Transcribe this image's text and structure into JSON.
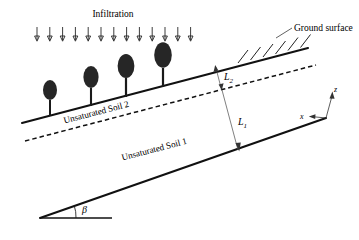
{
  "figure": {
    "background_color": "#ffffff",
    "ink_color": "#111111"
  },
  "labels": {
    "infiltration": "Infiltration",
    "ground_surface": "Ground surface",
    "soil_upper": "Unsaturated Soil 2",
    "soil_lower": "Unsaturated Soil 1",
    "depth_upper": "L",
    "depth_upper_sub": "2",
    "depth_lower": "L",
    "depth_lower_sub": "1",
    "axis_z": "z",
    "axis_x": "x",
    "slope_angle": "β"
  },
  "geometry": {
    "slope_angle_degrees": 14.5,
    "apex": {
      "x": 40,
      "y": 218
    },
    "ground_surface_line": {
      "x1": 22,
      "y1": 123,
      "x2": 300,
      "y2": 50
    },
    "interface_line": {
      "x1": 25,
      "y1": 141,
      "x2": 312,
      "y2": 66
    },
    "bottom_line": {
      "x1": 40,
      "y1": 218,
      "x2": 326,
      "y2": 118
    },
    "base_horizontal": {
      "x1": 40,
      "y1": 218,
      "x2": 112,
      "y2": 218
    }
  },
  "infiltration_arrows": {
    "count": 13,
    "x_start": 37,
    "x_spacing": 12.8,
    "y_top": 27,
    "y_bottom": 41
  },
  "trees": [
    {
      "trunk_x": 50,
      "base_y": 116,
      "canopy_cy": 90,
      "canopy_rx": 7.0,
      "canopy_ry": 10.0
    },
    {
      "trunk_x": 91,
      "base_y": 106,
      "canopy_cy": 77,
      "canopy_rx": 7.6,
      "canopy_ry": 11.0
    },
    {
      "trunk_x": 126,
      "base_y": 97,
      "canopy_cy": 66,
      "canopy_rx": 8.4,
      "canopy_ry": 12.0
    },
    {
      "trunk_x": 163,
      "base_y": 87,
      "canopy_cy": 55,
      "canopy_rx": 8.8,
      "canopy_ry": 12.8
    }
  ],
  "hatching": {
    "count": 6,
    "x_start": 238,
    "x_spacing": 12.5,
    "length": 13
  },
  "dimensions": [
    {
      "name": "L2",
      "from_y": 64,
      "to_y": 88,
      "x": 222
    },
    {
      "name": "L1",
      "from_y": 92,
      "to_y": 150,
      "x": 232
    }
  ],
  "axes": {
    "origin": {
      "x": 326,
      "y": 118
    },
    "z_tip": {
      "x": 333,
      "y": 92
    },
    "x_tip": {
      "x": 306,
      "y": 117
    }
  }
}
